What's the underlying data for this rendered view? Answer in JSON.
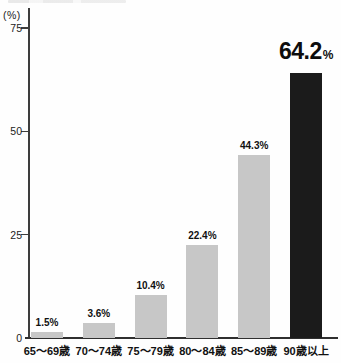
{
  "chart_data": {
    "type": "bar",
    "title": "",
    "unit_label": "(%)",
    "categories": [
      "65〜69歳",
      "70〜74歳",
      "75〜79歳",
      "80〜84歳",
      "85〜89歳",
      "90歳以上"
    ],
    "values": [
      1.5,
      3.6,
      10.4,
      22.4,
      44.3,
      64.2
    ],
    "value_labels": [
      "1.5%",
      "3.6%",
      "10.4%",
      "22.4%",
      "44.3%",
      "64.2%"
    ],
    "highlight_index": 5,
    "highlight_label": {
      "number": "64.2",
      "percent": "%"
    },
    "ylabel": "(%)",
    "ylim": [
      0,
      75
    ],
    "yticks": [
      0,
      25,
      50,
      75
    ],
    "grid": "off",
    "legend": "none",
    "bar_color": "#c7c7c7",
    "highlight_color": "#1b1b1b",
    "axis_color": "#3d3d3d"
  }
}
